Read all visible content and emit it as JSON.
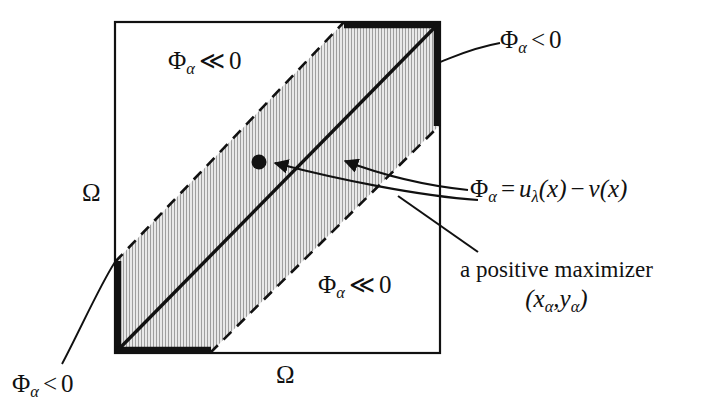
{
  "figure": {
    "domain_label": "Ω",
    "colors": {
      "line": "#111111",
      "shading_fill": "#e3e3e3",
      "shading_hatch": "#9a9a9a",
      "background": "#ffffff"
    },
    "square": {
      "x": 115,
      "y": 22,
      "width": 325,
      "height": 331
    },
    "marker_point": {
      "x": 259,
      "y": 162,
      "radius": 7
    }
  },
  "labels": {
    "phi_much_less_zero_upper": {
      "symbol": "Φ",
      "subscript": "α",
      "relation": "≪",
      "value": "0"
    },
    "phi_much_less_zero_lower": {
      "symbol": "Φ",
      "subscript": "α",
      "relation": "≪",
      "value": "0"
    },
    "phi_less_zero_topright": {
      "symbol": "Φ",
      "subscript": "α",
      "relation": "<",
      "value": "0"
    },
    "phi_less_zero_bottomleft": {
      "symbol": "Φ",
      "subscript": "α",
      "relation": "<",
      "value": "0"
    },
    "formula": {
      "symbol": "Φ",
      "subscript": "α",
      "equals": "=",
      "rhs_u": "u",
      "rhs_u_sub": "λ",
      "rhs_u_arg": "(x)",
      "minus": "−",
      "rhs_v": "v",
      "rhs_v_arg": "(x)"
    },
    "maximizer": {
      "text": "a positive maximizer",
      "coords_open": "(",
      "coords_x": "x",
      "coords_x_sub": "α",
      "coords_sep": ",",
      "coords_y": "y",
      "coords_y_sub": "α",
      "coords_close": ")"
    },
    "axis_left": "Ω",
    "axis_bottom": "Ω"
  }
}
